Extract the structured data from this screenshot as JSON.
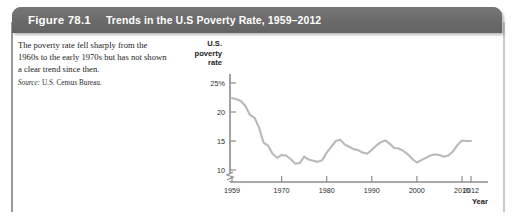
{
  "figure": {
    "number_label": "Figure 78.1",
    "title": "Trends in the U.S Poverty Rate, 1959–2012",
    "caption_text": "The poverty rate fell sharply from the 1960s to the early 1970s but has not shown a clear trend since then.",
    "source_label": "Source:",
    "source_text": "U.S. Census Bureau."
  },
  "colors": {
    "header_bar": "#6e6e6e",
    "header_text": "#ffffff",
    "line": "#b9b9b9",
    "axis": "#8c8c8c",
    "text": "#1b1b1b",
    "page": "#ffffff"
  },
  "chart_data": {
    "type": "line",
    "title": "Trends in the U.S Poverty Rate, 1959–2012",
    "xlabel": "Year",
    "ylabel": "U.S. poverty rate",
    "ylabel_lines": [
      "U.S.",
      "poverty",
      "rate"
    ],
    "ytick_labels": [
      "25%",
      "20",
      "15",
      "10"
    ],
    "ytick_values": [
      25,
      20,
      15,
      10
    ],
    "xtick_labels": [
      "1959",
      "1970",
      "1980",
      "1990",
      "2000",
      "2010",
      "2012"
    ],
    "xtick_values": [
      1959,
      1970,
      1980,
      1990,
      2000,
      2010,
      2012
    ],
    "xlim": [
      1959,
      2012
    ],
    "ylim": [
      9,
      26
    ],
    "grid": false,
    "legend": false,
    "axis_break_y": true,
    "axis_break_x": true,
    "series": [
      {
        "name": "U.S. poverty rate",
        "x": [
          1959,
          1960,
          1961,
          1962,
          1963,
          1964,
          1965,
          1966,
          1967,
          1968,
          1969,
          1970,
          1971,
          1972,
          1973,
          1974,
          1975,
          1976,
          1977,
          1978,
          1979,
          1980,
          1981,
          1982,
          1983,
          1984,
          1985,
          1986,
          1987,
          1988,
          1989,
          1990,
          1991,
          1992,
          1993,
          1994,
          1995,
          1996,
          1997,
          1998,
          1999,
          2000,
          2001,
          2002,
          2003,
          2004,
          2005,
          2006,
          2007,
          2008,
          2009,
          2010,
          2011,
          2012
        ],
        "values": [
          22.4,
          22.2,
          21.9,
          21.0,
          19.5,
          19.0,
          17.3,
          14.7,
          14.2,
          12.8,
          12.1,
          12.6,
          12.5,
          11.9,
          11.1,
          11.2,
          12.3,
          11.8,
          11.6,
          11.4,
          11.7,
          13.0,
          14.0,
          15.0,
          15.2,
          14.4,
          14.0,
          13.6,
          13.4,
          13.0,
          12.8,
          13.5,
          14.2,
          14.8,
          15.1,
          14.5,
          13.8,
          13.7,
          13.3,
          12.7,
          11.9,
          11.3,
          11.7,
          12.1,
          12.5,
          12.7,
          12.6,
          12.3,
          12.5,
          13.2,
          14.3,
          15.1,
          15.0,
          15.0
        ]
      }
    ]
  }
}
